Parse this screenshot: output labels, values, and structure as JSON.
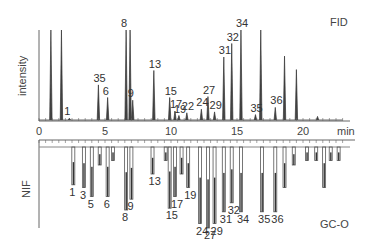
{
  "chart_data": [
    {
      "type": "line",
      "title": "FID",
      "panel": "top",
      "xlabel": "min",
      "ylabel": "intensity",
      "xlim": [
        0,
        23
      ],
      "x_ticks": [
        0,
        5,
        10,
        15,
        20
      ],
      "grid": false,
      "peaks": [
        {
          "t": 0.9,
          "h": 1.0,
          "label": ""
        },
        {
          "t": 1.7,
          "h": 1.0,
          "label": ""
        },
        {
          "t": 2.3,
          "h": 0.02,
          "label": "1"
        },
        {
          "t": 4.5,
          "h": 0.39,
          "label": "35"
        },
        {
          "t": 5.2,
          "h": 0.25,
          "label": "6"
        },
        {
          "t": 6.6,
          "h": 1.0,
          "label": "8"
        },
        {
          "t": 6.9,
          "h": 1.0,
          "label": ""
        },
        {
          "t": 7.1,
          "h": 0.22,
          "label": "9"
        },
        {
          "t": 8.7,
          "h": 0.55,
          "label": "13"
        },
        {
          "t": 9.9,
          "h": 0.25,
          "label": "15"
        },
        {
          "t": 10.3,
          "h": 0.1,
          "label": "17"
        },
        {
          "t": 10.6,
          "h": 0.05,
          "label": "19"
        },
        {
          "t": 11.2,
          "h": 0.08,
          "label": "22"
        },
        {
          "t": 12.3,
          "h": 0.12,
          "label": "24"
        },
        {
          "t": 12.8,
          "h": 0.26,
          "label": "27"
        },
        {
          "t": 13.3,
          "h": 0.09,
          "label": "29"
        },
        {
          "t": 14.0,
          "h": 0.7,
          "label": "31"
        },
        {
          "t": 14.6,
          "h": 0.85,
          "label": "32"
        },
        {
          "t": 15.3,
          "h": 1.0,
          "label": "34"
        },
        {
          "t": 16.4,
          "h": 0.06,
          "label": "35"
        },
        {
          "t": 16.8,
          "h": 1.0,
          "label": ""
        },
        {
          "t": 17.9,
          "h": 0.14,
          "label": "36"
        },
        {
          "t": 18.6,
          "h": 0.71,
          "label": ""
        },
        {
          "t": 19.5,
          "h": 0.56,
          "label": ""
        },
        {
          "t": 21.1,
          "h": 0.04,
          "label": ""
        }
      ]
    },
    {
      "type": "bar",
      "title": "GC-O",
      "panel": "bottom",
      "xlabel": "min",
      "ylabel": "NIF",
      "xlim": [
        0,
        23
      ],
      "inverted": true,
      "grid": false,
      "bars": [
        {
          "t": 2.6,
          "d": 0.42,
          "label": "1"
        },
        {
          "t": 3.4,
          "d": 0.45,
          "label": "3"
        },
        {
          "t": 4.0,
          "d": 0.55,
          "label": "5"
        },
        {
          "t": 4.6,
          "d": 0.2,
          "label": ""
        },
        {
          "t": 5.2,
          "d": 0.55,
          "label": "6"
        },
        {
          "t": 5.6,
          "d": 0.15,
          "label": ""
        },
        {
          "t": 6.6,
          "d": 0.7,
          "label": "8"
        },
        {
          "t": 7.0,
          "d": 0.58,
          "label": "9"
        },
        {
          "t": 8.6,
          "d": 0.3,
          "label": "13"
        },
        {
          "t": 9.6,
          "d": 0.15,
          "label": ""
        },
        {
          "t": 9.9,
          "d": 0.68,
          "label": "15"
        },
        {
          "t": 10.3,
          "d": 0.55,
          "label": "17"
        },
        {
          "t": 10.8,
          "d": 0.3,
          "label": ""
        },
        {
          "t": 11.3,
          "d": 0.45,
          "label": "19"
        },
        {
          "t": 12.2,
          "d": 0.85,
          "label": "24"
        },
        {
          "t": 12.8,
          "d": 0.9,
          "label": "27"
        },
        {
          "t": 13.3,
          "d": 0.85,
          "label": "29"
        },
        {
          "t": 14.0,
          "d": 0.72,
          "label": "31"
        },
        {
          "t": 14.6,
          "d": 0.62,
          "label": "32"
        },
        {
          "t": 15.3,
          "d": 0.72,
          "label": "34"
        },
        {
          "t": 16.9,
          "d": 0.72,
          "label": "35"
        },
        {
          "t": 17.9,
          "d": 0.72,
          "label": "36"
        },
        {
          "t": 18.6,
          "d": 0.45,
          "label": ""
        },
        {
          "t": 19.3,
          "d": 0.2,
          "label": ""
        },
        {
          "t": 20.3,
          "d": 0.15,
          "label": ""
        },
        {
          "t": 21.0,
          "d": 0.15,
          "label": ""
        },
        {
          "t": 21.6,
          "d": 0.45,
          "label": ""
        },
        {
          "t": 22.1,
          "d": 0.15,
          "label": ""
        },
        {
          "t": 22.7,
          "d": 0.15,
          "label": ""
        }
      ]
    }
  ],
  "labels": {
    "fid": "FID",
    "gco": "GC-O",
    "intensity": "intensity",
    "nif": "NIF",
    "min": "min",
    "ticks": [
      "0",
      "5",
      "10",
      "15",
      "20"
    ]
  }
}
